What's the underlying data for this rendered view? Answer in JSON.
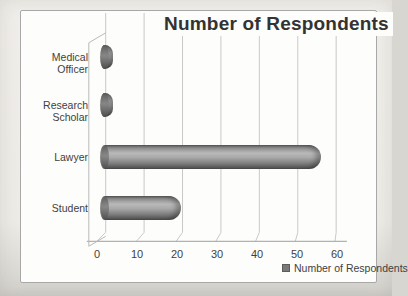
{
  "chart_data": {
    "type": "bar",
    "orientation": "horizontal",
    "style": "3d-cylinder",
    "title": "Number of Respondents",
    "categories": [
      "Medical Officer",
      "Research Scholar",
      "Lawyer",
      "Student"
    ],
    "values": [
      3,
      3,
      55,
      20
    ],
    "xlabel": "",
    "ylabel": "",
    "xlim": [
      0,
      60
    ],
    "xticks": [
      "0",
      "10",
      "20",
      "30",
      "40",
      "50",
      "60"
    ],
    "grid": true,
    "legend": {
      "position": "bottom-right",
      "entries": [
        "Number of Respondents"
      ]
    },
    "bar_color": "#8f8f8f",
    "gridline_color": "#c9c9c9",
    "axis_color": "#9e9e9e",
    "text_color": "#3f3f3f"
  }
}
